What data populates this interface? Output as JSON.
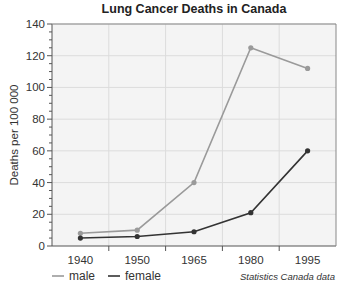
{
  "chart_data": {
    "type": "line",
    "title": "Lung Cancer Deaths in Canada",
    "xlabel": "",
    "ylabel": "Deaths per 100 000",
    "categories": [
      "1940",
      "1950",
      "1965",
      "1980",
      "1995"
    ],
    "series": [
      {
        "name": "male",
        "color": "#9a9a9a",
        "values": [
          8,
          10,
          40,
          125,
          112
        ]
      },
      {
        "name": "female",
        "color": "#333333",
        "values": [
          5,
          6,
          9,
          21,
          60
        ]
      }
    ],
    "ylim": [
      0,
      140
    ],
    "yticks": [
      0,
      20,
      40,
      60,
      80,
      100,
      120,
      140
    ],
    "grid": true,
    "legend_position": "bottom-left",
    "annotations": [
      "Statistics Canada data"
    ]
  },
  "source_note": "Statistics Canada data",
  "colors": {
    "plot_bg": "#f4f4f4",
    "grid": "#dcdcdc",
    "axis": "#555555"
  }
}
